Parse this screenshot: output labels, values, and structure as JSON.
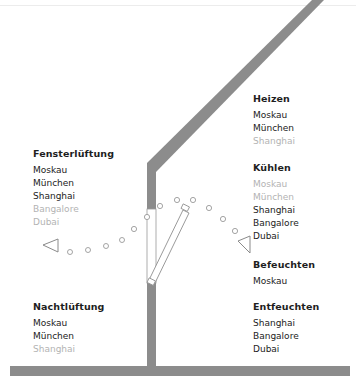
{
  "colors": {
    "structure": "#8c8c8c",
    "active_text": "#222222",
    "inactive_text": "#b3b3b3",
    "airflow": "#9a9a9a"
  },
  "groups": {
    "heizen": {
      "title": "Heizen",
      "items": [
        {
          "label": "Moskau",
          "active": true
        },
        {
          "label": "München",
          "active": true
        },
        {
          "label": "Shanghai",
          "active": false
        }
      ]
    },
    "kuehlen": {
      "title": "Kühlen",
      "items": [
        {
          "label": "Moskau",
          "active": false
        },
        {
          "label": "München",
          "active": false
        },
        {
          "label": "Shanghai",
          "active": true
        },
        {
          "label": "Bangalore",
          "active": true
        },
        {
          "label": "Dubai",
          "active": true
        }
      ]
    },
    "befeuchten": {
      "title": "Befeuchten",
      "items": [
        {
          "label": "Moskau",
          "active": true
        }
      ]
    },
    "entfeuchten": {
      "title": "Entfeuchten",
      "items": [
        {
          "label": "Shanghai",
          "active": true
        },
        {
          "label": "Bangalore",
          "active": true
        },
        {
          "label": "Dubai",
          "active": true
        }
      ]
    },
    "fensterlueftung": {
      "title": "Fensterlüftung",
      "items": [
        {
          "label": "Moskau",
          "active": true
        },
        {
          "label": "München",
          "active": true
        },
        {
          "label": "Shanghai",
          "active": true
        },
        {
          "label": "Bangalore",
          "active": false
        },
        {
          "label": "Dubai",
          "active": false
        }
      ]
    },
    "nachtlueftung": {
      "title": "Nachtlüftung",
      "items": [
        {
          "label": "Moskau",
          "active": true
        },
        {
          "label": "München",
          "active": true
        },
        {
          "label": "Shanghai",
          "active": false
        }
      ]
    }
  },
  "diagram": {
    "elements": [
      "roof",
      "wall",
      "floor",
      "open-window",
      "airflow-arc",
      "airflow-arrow-left",
      "airflow-arrow-right"
    ]
  }
}
